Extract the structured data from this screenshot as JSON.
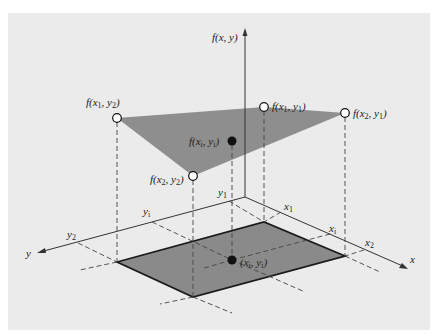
{
  "figure": {
    "type": "3d-bilinear-interpolation-diagram",
    "axes": {
      "z_label": "f(x, y)",
      "x_label": "x",
      "y_label": "y"
    },
    "x_ticks": [
      "x1",
      "xi",
      "x2"
    ],
    "y_ticks": [
      "y1",
      "yi",
      "y2"
    ],
    "surface_points": [
      {
        "id": "f_x1_y2",
        "label": "f(x1, y2)",
        "style": "open-circle"
      },
      {
        "id": "f_x1_y1",
        "label": "f(x1, y1)",
        "style": "open-circle"
      },
      {
        "id": "f_x2_y1",
        "label": "f(x2, y1)",
        "style": "open-circle"
      },
      {
        "id": "f_x2_y2",
        "label": "f(x2, y2)",
        "style": "open-circle"
      },
      {
        "id": "f_xi_yi",
        "label": "f(xi, yi)",
        "style": "filled-circle"
      }
    ],
    "base_point": {
      "label": "(xi, yi)",
      "style": "filled-circle"
    },
    "colors": {
      "background": "#ebebeb",
      "plane_fill": "#8e8e8e",
      "base_fill": "#8a8a8a",
      "line": "#222222"
    }
  }
}
